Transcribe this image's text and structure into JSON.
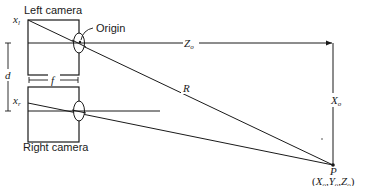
{
  "diagram": {
    "labels": {
      "left_camera": "Left camera",
      "right_camera": "Right camera",
      "origin": "Origin",
      "xl": "x",
      "xl_sub": "l",
      "xr": "x",
      "xr_sub": "r",
      "d": "d",
      "f": "f",
      "Z": "Z",
      "Z_sub": "o",
      "R": "R",
      "X": "X",
      "X_sub": "o",
      "P": "P",
      "P_coords_open": "(",
      "P_X": "X",
      "P_Y": "Y",
      "P_Z": "Z",
      "P_sub": "o",
      "P_comma": ",",
      "P_coords_close": ")"
    },
    "colors": {
      "ink": "#1a1a1a",
      "background": "#ffffff"
    }
  }
}
